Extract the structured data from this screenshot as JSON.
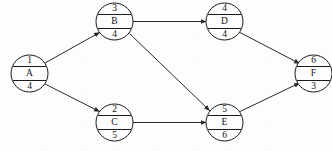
{
  "diagram": {
    "type": "activity-on-node-network",
    "background_color": "#fdfdfd",
    "line_color": "#2a2a2a",
    "text_color": "#111111",
    "nodes": [
      {
        "id": "A",
        "label": "A",
        "top": "1",
        "bottom": "4",
        "cx": 29.5,
        "cy": 73.5,
        "r": 18.5
      },
      {
        "id": "B",
        "label": "B",
        "top": "3",
        "bottom": "4",
        "cx": 114.5,
        "cy": 21.5,
        "r": 18.5
      },
      {
        "id": "C",
        "label": "C",
        "top": "2",
        "bottom": "5",
        "cx": 114.5,
        "cy": 122.5,
        "r": 18.5
      },
      {
        "id": "D",
        "label": "D",
        "top": "4",
        "bottom": "4",
        "cx": 224.5,
        "cy": 21.5,
        "r": 18.5
      },
      {
        "id": "E",
        "label": "E",
        "top": "5",
        "bottom": "6",
        "cx": 224.5,
        "cy": 122.5,
        "r": 18.5
      },
      {
        "id": "F",
        "label": "F",
        "top": "6",
        "bottom": "3",
        "cx": 313.5,
        "cy": 73.5,
        "r": 18.5
      }
    ],
    "edges": [
      {
        "id": "a-b",
        "from": "A",
        "to": "B"
      },
      {
        "id": "a-c",
        "from": "A",
        "to": "C"
      },
      {
        "id": "b-d",
        "from": "B",
        "to": "D"
      },
      {
        "id": "b-e",
        "from": "B",
        "to": "E"
      },
      {
        "id": "c-e",
        "from": "C",
        "to": "E"
      },
      {
        "id": "d-f",
        "from": "D",
        "to": "F"
      },
      {
        "id": "e-f",
        "from": "E",
        "to": "F"
      }
    ]
  }
}
